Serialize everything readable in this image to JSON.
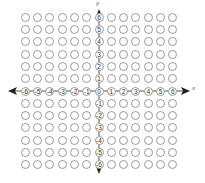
{
  "figure": {
    "grid": {
      "x_min": -6,
      "x_max": 6,
      "y_min": -6,
      "y_max": 6,
      "cell_px": 12.3,
      "origin_px": [
        99,
        91
      ],
      "circle_stroke": "#9a9a9a"
    },
    "axes": {
      "x_label": "x",
      "y_label": "y",
      "x_ticks": [
        "-6",
        "-5",
        "-4",
        "-3",
        "-2",
        "-1",
        "0",
        "1",
        "2",
        "3",
        "4",
        "5",
        "6"
      ],
      "y_ticks": [
        "6",
        "5",
        "4",
        "3",
        "2",
        "1",
        "0",
        "-1",
        "-2",
        "-3",
        "-4",
        "-5",
        "-6"
      ],
      "axis_color": "#333333",
      "arrows": [
        "left",
        "right",
        "up",
        "down"
      ]
    }
  }
}
